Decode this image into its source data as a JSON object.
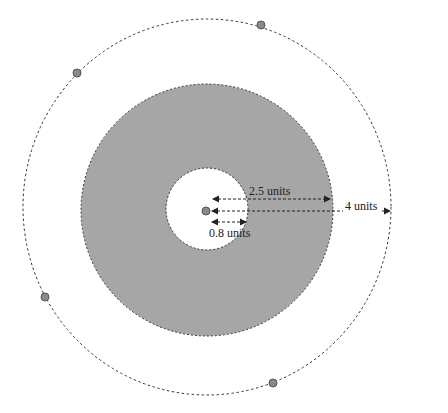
{
  "diagram": {
    "type": "concentric-circles",
    "colors": {
      "background": "#ffffff",
      "annulus_fill": "#a6a6a6",
      "hole_fill": "#ffffff",
      "stroke": "#333333",
      "dot_fill": "#8a8a8a"
    },
    "labels": {
      "outer_radius": "4 units",
      "annulus_outer_radius": "2.5 units",
      "inner_radius": "0.8 units"
    },
    "radii_units": {
      "inner": 0.8,
      "annulus_outer": 2.5,
      "outer_orbit": 4
    },
    "orbit_dots": [
      {
        "x": 261,
        "y": 25
      },
      {
        "x": 77,
        "y": 73
      },
      {
        "x": 45,
        "y": 297
      },
      {
        "x": 273,
        "y": 383
      }
    ]
  }
}
